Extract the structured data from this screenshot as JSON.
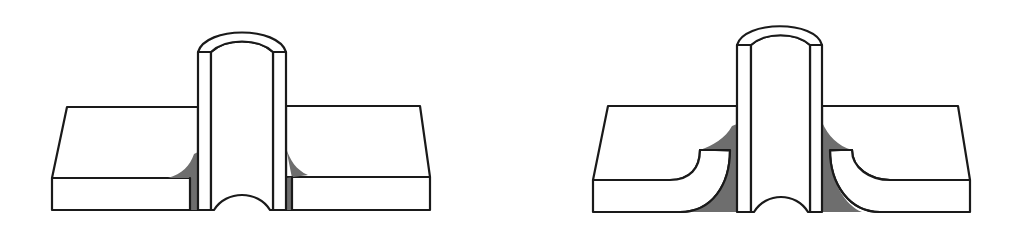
{
  "figure": {
    "colors": {
      "line": "#1a1a1a",
      "weld": "#6e6e6e",
      "background": "#ffffff"
    },
    "panels": [
      {
        "id": "left",
        "label": "",
        "variant": "fillet weld, flat plate"
      },
      {
        "id": "right",
        "label": "",
        "variant": "fillet weld, flanged (curved) plate hole"
      }
    ]
  }
}
